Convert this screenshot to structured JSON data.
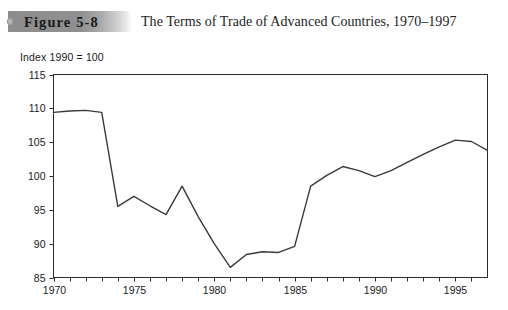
{
  "header": {
    "figure_number": "Figure 5-8",
    "title": "The Terms of Trade of Advanced Countries, 1970–1997",
    "band_color": "#8d8d8d",
    "dot_icon": "bullet-dot-icon"
  },
  "chart_data": {
    "type": "line",
    "title": "The Terms of Trade of Advanced Countries, 1970–1997",
    "subtitle": "Index 1990 = 100",
    "xlabel": "",
    "ylabel": "",
    "axis_note": "Index 1990 = 100",
    "xlim": [
      1970,
      1997
    ],
    "ylim": [
      85,
      115
    ],
    "yticks": [
      85,
      90,
      95,
      100,
      105,
      110,
      115
    ],
    "ytick_labels": [
      "85",
      "90",
      "95",
      "100",
      "105",
      "110",
      "115"
    ],
    "xticks": [
      1970,
      1971,
      1972,
      1973,
      1974,
      1975,
      1976,
      1977,
      1978,
      1979,
      1980,
      1981,
      1982,
      1983,
      1984,
      1985,
      1986,
      1987,
      1988,
      1989,
      1990,
      1991,
      1992,
      1993,
      1994,
      1995,
      1996,
      1997
    ],
    "xtick_labels_shown": [
      "1970",
      "1975",
      "1980",
      "1985",
      "1990",
      "1995"
    ],
    "xtick_labeled_values": [
      1970,
      1975,
      1980,
      1985,
      1990,
      1995
    ],
    "grid": false,
    "legend": false,
    "line_color": "#3a3a3a",
    "line_width": 1.4,
    "x": [
      1970,
      1971,
      1972,
      1973,
      1974,
      1975,
      1976,
      1977,
      1978,
      1979,
      1980,
      1981,
      1982,
      1983,
      1984,
      1985,
      1986,
      1987,
      1988,
      1989,
      1990,
      1991,
      1992,
      1993,
      1994,
      1995,
      1996,
      1997
    ],
    "values": [
      109.4,
      109.6,
      109.7,
      109.4,
      95.5,
      97.0,
      95.6,
      94.3,
      98.5,
      94.0,
      90.0,
      86.5,
      88.4,
      88.8,
      88.7,
      89.6,
      98.5,
      100.1,
      101.4,
      100.8,
      99.9,
      100.8,
      102.0,
      103.2,
      104.3,
      105.3,
      105.1,
      103.8
    ],
    "series": [
      {
        "name": "Terms of trade index",
        "values": [
          109.4,
          109.6,
          109.7,
          109.4,
          95.5,
          97.0,
          95.6,
          94.3,
          98.5,
          94.0,
          90.0,
          86.5,
          88.4,
          88.8,
          88.7,
          89.6,
          98.5,
          100.1,
          101.4,
          100.8,
          99.9,
          100.8,
          102.0,
          103.2,
          104.3,
          105.3,
          105.1,
          103.8
        ]
      }
    ]
  }
}
